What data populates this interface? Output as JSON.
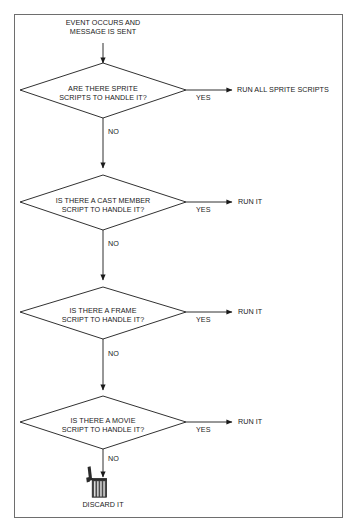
{
  "diagram": {
    "start_label": "EVENT OCCURS AND\nMESSAGE IS SENT",
    "terminal_label": "DISCARD IT",
    "yes_label": "YES",
    "no_label": "NO",
    "colors": {
      "stroke": "#1a1a1a",
      "frame": "#6e6e6e",
      "background": "#ffffff",
      "trash_body": "#3d3d3d",
      "trash_lid": "#2b2b2b"
    },
    "steps": [
      {
        "question": "ARE THERE SPRITE\nSCRIPTS TO HANDLE IT?",
        "yes_label": "YES",
        "yes_result": "RUN ALL SPRITE SCRIPTS",
        "no_label": "NO"
      },
      {
        "question": "IS THERE A CAST MEMBER\nSCRIPT TO HANDLE IT?",
        "yes_label": "YES",
        "yes_result": "RUN IT",
        "no_label": "NO"
      },
      {
        "question": "IS THERE A FRAME\nSCRIPT TO HANDLE IT?",
        "yes_label": "YES",
        "yes_result": "RUN IT",
        "no_label": "NO"
      },
      {
        "question": "IS THERE A MOVIE\nSCRIPT TO HANDLE IT?",
        "yes_label": "YES",
        "yes_result": "RUN IT",
        "no_label": "NO"
      }
    ],
    "icons": {
      "trash": "trash-can-icon",
      "arrow": "arrow-head-icon"
    }
  }
}
